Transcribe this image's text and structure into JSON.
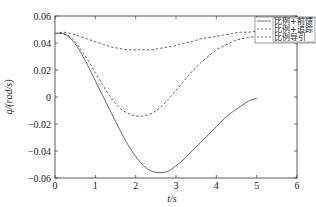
{
  "chart_data": {
    "type": "line",
    "title": "",
    "xlabel": "t/s",
    "ylabel": "q/(rad/s)",
    "xlim": [
      0,
      6
    ],
    "ylim": [
      -0.06,
      0.06
    ],
    "xticks": [
      "0",
      "1",
      "2",
      "3",
      "4",
      "5",
      "6"
    ],
    "yticks": [
      "0.06",
      "0.04",
      "0.02",
      "0",
      "−0.02",
      "−0.04",
      "−0.06"
    ],
    "grid": false,
    "legend_position": "upper right",
    "series": [
      {
        "name": "比例+前馈",
        "style": "solid",
        "x": [
          0,
          0.2,
          0.4,
          0.6,
          0.8,
          1.0,
          1.2,
          1.4,
          1.6,
          1.8,
          2.0,
          2.2,
          2.4,
          2.6,
          2.8,
          3.0,
          3.2,
          3.4,
          3.6,
          3.8,
          4.0,
          4.2,
          4.4,
          4.6,
          4.8,
          5.0
        ],
        "y": [
          0.047,
          0.047,
          0.043,
          0.035,
          0.024,
          0.012,
          0.0,
          -0.012,
          -0.024,
          -0.035,
          -0.044,
          -0.051,
          -0.055,
          -0.056,
          -0.055,
          -0.051,
          -0.046,
          -0.04,
          -0.034,
          -0.028,
          -0.022,
          -0.016,
          -0.011,
          -0.007,
          -0.003,
          -0.001
        ]
      },
      {
        "name": "比例+追踪",
        "style": "dashed",
        "x": [
          0,
          0.2,
          0.4,
          0.6,
          0.8,
          1.0,
          1.2,
          1.4,
          1.6,
          1.8,
          2.0,
          2.2,
          2.4,
          2.6,
          2.8,
          3.0,
          3.2,
          3.4,
          3.6,
          3.8,
          4.0,
          4.2,
          4.4,
          4.6,
          4.8,
          5.0
        ],
        "y": [
          0.047,
          0.047,
          0.044,
          0.037,
          0.028,
          0.018,
          0.008,
          -0.001,
          -0.008,
          -0.012,
          -0.014,
          -0.014,
          -0.012,
          -0.008,
          -0.002,
          0.005,
          0.012,
          0.019,
          0.025,
          0.03,
          0.035,
          0.038,
          0.041,
          0.043,
          0.044,
          0.045
        ]
      },
      {
        "name": "比例导引",
        "style": "dashed",
        "x": [
          0,
          0.2,
          0.4,
          0.6,
          0.8,
          1.0,
          1.2,
          1.4,
          1.6,
          1.8,
          2.0,
          2.2,
          2.4,
          2.6,
          2.8,
          3.0,
          3.2,
          3.4,
          3.6,
          3.8,
          4.0,
          4.2,
          4.4,
          4.6,
          4.8,
          5.0
        ],
        "y": [
          0.047,
          0.048,
          0.047,
          0.045,
          0.043,
          0.041,
          0.039,
          0.037,
          0.036,
          0.035,
          0.035,
          0.035,
          0.035,
          0.036,
          0.037,
          0.038,
          0.04,
          0.041,
          0.043,
          0.044,
          0.045,
          0.046,
          0.047,
          0.048,
          0.048,
          0.049
        ]
      }
    ]
  },
  "legend": {
    "items": [
      {
        "label": "比例+前馈",
        "style": "solid"
      },
      {
        "label": "比例+追踪",
        "style": "dashed"
      },
      {
        "label": "比例导引",
        "style": "dashed"
      }
    ]
  },
  "colors": {
    "line": "#555555",
    "axis": "#333333"
  }
}
